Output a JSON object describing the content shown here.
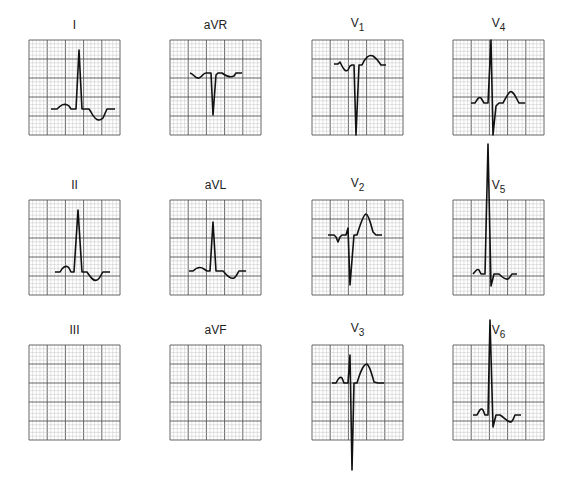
{
  "figure": {
    "grid": {
      "width": 91,
      "height": 95,
      "major_cols": 5,
      "major_rows": 5,
      "minor_per_major": 5,
      "major_color": "#555555",
      "minor_color": "#b8b8b8",
      "trace_color": "#111111"
    },
    "leads": [
      {
        "id": "I",
        "name": "I",
        "sub": "",
        "x": 29,
        "y": 40,
        "label_y": 18
      },
      {
        "id": "aVR",
        "name": "aVR",
        "sub": "",
        "x": 170,
        "y": 40,
        "label_y": 18
      },
      {
        "id": "V1",
        "name": "V",
        "sub": "1",
        "x": 312,
        "y": 40,
        "label_y": 16
      },
      {
        "id": "V4",
        "name": "V",
        "sub": "4",
        "x": 453,
        "y": 40,
        "label_y": 16
      },
      {
        "id": "II",
        "name": "II",
        "sub": "",
        "x": 29,
        "y": 200,
        "label_y": 178
      },
      {
        "id": "aVL",
        "name": "aVL",
        "sub": "",
        "x": 170,
        "y": 200,
        "label_y": 178
      },
      {
        "id": "V2",
        "name": "V",
        "sub": "2",
        "x": 312,
        "y": 200,
        "label_y": 176
      },
      {
        "id": "V5",
        "name": "V",
        "sub": "5",
        "x": 453,
        "y": 200,
        "label_y": 178
      },
      {
        "id": "III",
        "name": "III",
        "sub": "",
        "x": 29,
        "y": 345,
        "label_y": 323
      },
      {
        "id": "aVF",
        "name": "aVF",
        "sub": "",
        "x": 170,
        "y": 345,
        "label_y": 323
      },
      {
        "id": "V3",
        "name": "V",
        "sub": "3",
        "x": 312,
        "y": 345,
        "label_y": 321
      },
      {
        "id": "V6",
        "name": "V",
        "sub": "6",
        "x": 453,
        "y": 345,
        "label_y": 323
      }
    ],
    "traces": {
      "I": "M22,69 L28,69 C31,66 35,62 40,66 L42,69 L47,69 L50,10 L53,69 L60,69 L62,72 C66,80 70,82 74,78 L78,69 L86,69",
      "aVR": "M20,33 C24,34 25,39 29,38 C32,37 33,33 36,33 L39,33 L41,33 L43,75 L46,35 L48,33 L52,33 C56,36 60,38 64,36 L66,33 L72,33",
      "V1": "M22,24 L26,24 L28,22 L30,26 C32,30 34,32 36,30 L38,26 L40,25 L42,25 L44,95 L47,25 L50,25 C53,18 57,14 61,16 C64,18 67,22 69,25 L74,25",
      "V4": "M18,63 L22,63 C24,60 26,56 28,58 L31,63 L35,63 L38,0 L40,95 L43,66 L46,63 L50,63 C53,58 56,50 59,52 C62,54 64,60 66,63 L72,63",
      "II": "M26,72 L31,72 C33,68 37,64 40,68 L42,72 L45,72 L49,10 L53,72 L58,72 C61,76 64,82 68,80 C71,79 72,74 74,72 L81,72",
      "aVL": "M19,71 L23,71 C26,68 30,66 34,69 L37,71 L40,71 L43,22 L46,71 L53,71 C56,74 60,80 64,78 C67,76 68,72 69,71 L76,71",
      "V2": "M16,35 L22,35 L24,37 L26,42 L28,37 L30,35 L34,35 L36,28 L38,85 L42,35 L45,35 C48,25 51,15 54,14 C57,15 59,25 61,32 L64,35 L70,35",
      "V3": "M20,38 L24,38 C26,34 28,31 30,33 L32,38 L36,38 L38,10 L40,125 L42,38 L45,38 C48,28 51,19 55,19 C58,21 60,30 62,37 L66,38 L72,38",
      "V5": "M20,74 C22,72 24,68 26,70 L28,74 L32,74 L35,-56 L38,86 L41,74 L46,74 C49,77 52,80 55,79 C57,78 58,75 59,74 L64,74",
      "V6": "M20,70 L24,70 C26,66 28,62 30,65 L32,70 L35,70 L37,-25 L40,82 L43,70 L47,70 C51,72 54,77 58,77 C60,76 61,72 62,70 L68,70"
    }
  }
}
